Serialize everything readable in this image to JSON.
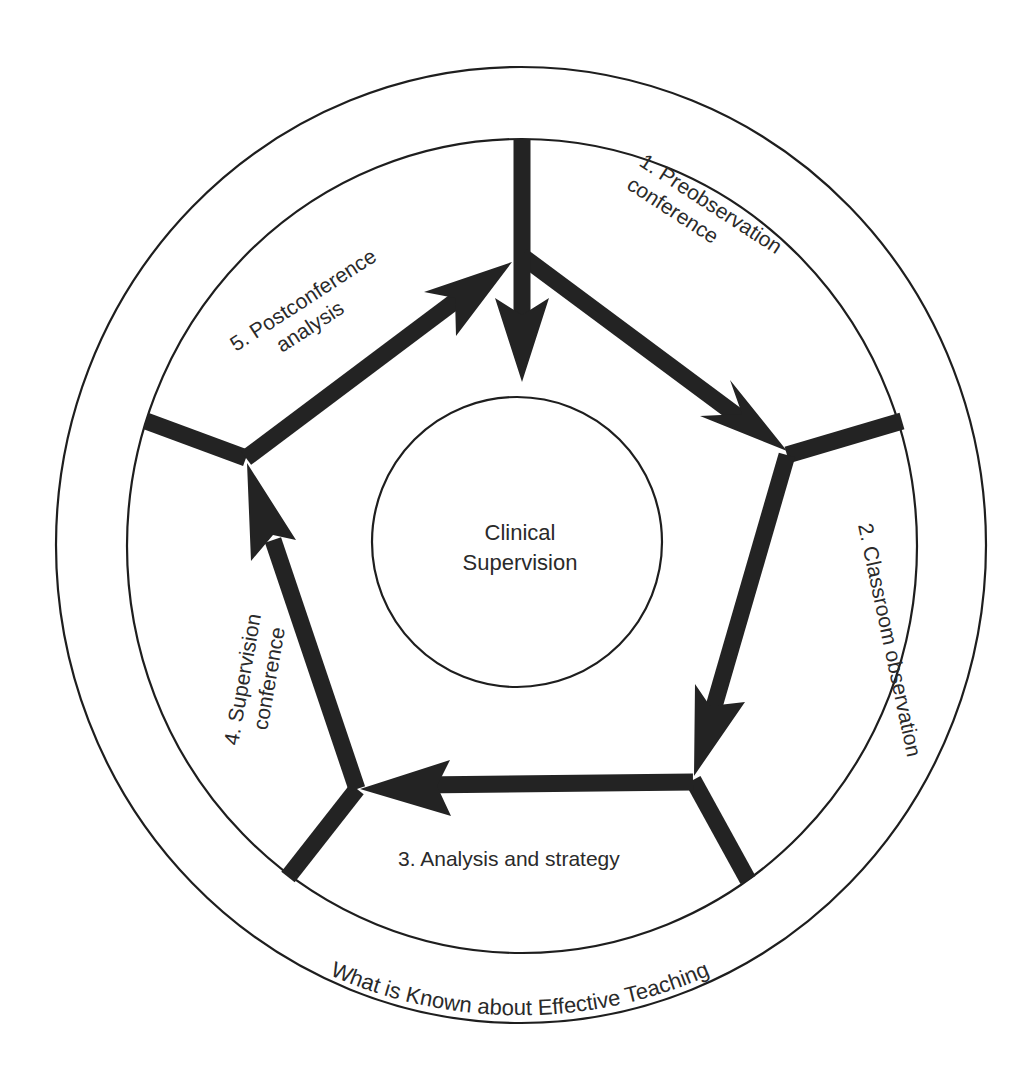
{
  "diagram": {
    "title": "Clinical Supervision",
    "center": {
      "line1": "Clinical",
      "line2": "Supervision"
    },
    "outer_ring_label": "What is Known about Effective Teaching",
    "steps": [
      {
        "number": "1.",
        "line1": "1. Preobservation",
        "line2": "conference"
      },
      {
        "number": "2.",
        "line1": "2. Classroom observation"
      },
      {
        "number": "3.",
        "line1": "3. Analysis and strategy"
      },
      {
        "number": "4.",
        "line1": "4. Supervision",
        "line2": "conference"
      },
      {
        "number": "5.",
        "line1": "5. Postconference",
        "line2": "analysis"
      }
    ],
    "colors": {
      "stroke": "#232323",
      "text": "#2a2a2a",
      "background": "#ffffff"
    }
  }
}
